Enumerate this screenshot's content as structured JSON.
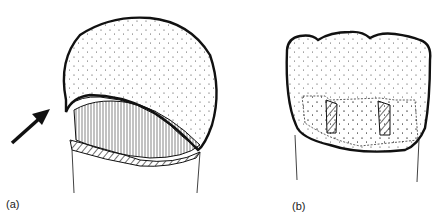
{
  "figure": {
    "panels": [
      {
        "id": "a",
        "label": "(a)",
        "description": "tooth crown lifted with arrow pointing at gap"
      },
      {
        "id": "b",
        "label": "(b)",
        "description": "tooth crown with two hatched pins"
      }
    ]
  },
  "colors": {
    "ink": "#111111",
    "background": "#ffffff"
  }
}
